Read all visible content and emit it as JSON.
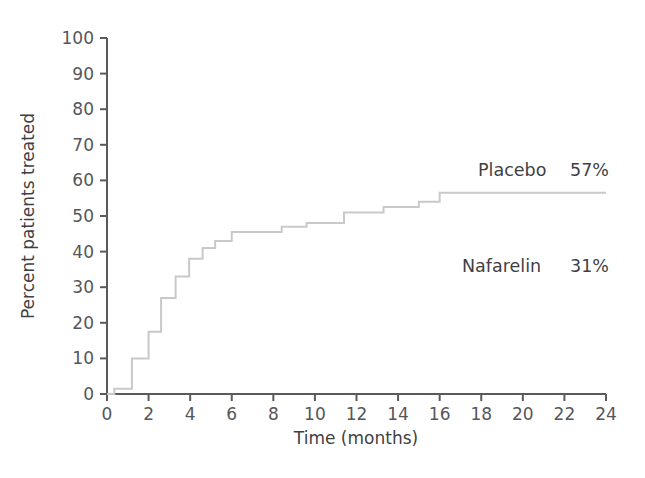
{
  "chart_data": {
    "type": "line",
    "subtype": "step-kaplan-meier-cumulative",
    "title": "",
    "xlabel": "Time (months)",
    "ylabel": "Percent patients treated",
    "xlim": [
      0,
      24
    ],
    "ylim": [
      0,
      100
    ],
    "xticks": [
      0,
      2,
      4,
      6,
      8,
      10,
      12,
      14,
      16,
      18,
      20,
      22,
      24
    ],
    "xtick_labels": [
      "0",
      "2",
      "4",
      "6",
      "8",
      "10",
      "12",
      "14",
      "16",
      "18",
      "20",
      "22",
      "24"
    ],
    "yticks": [
      0,
      10,
      20,
      30,
      40,
      50,
      60,
      70,
      80,
      90,
      100
    ],
    "ytick_labels": [
      "0",
      "10",
      "20",
      "30",
      "40",
      "50",
      "60",
      "70",
      "80",
      "90",
      "100"
    ],
    "grid": false,
    "legend_position": "inline-annotation",
    "series": [
      {
        "name": "Placebo",
        "final_value_label": "57%",
        "color": "#c9c9c9",
        "step_points": [
          [
            0,
            0
          ],
          [
            0.35,
            0
          ],
          [
            0.35,
            1.5
          ],
          [
            1.2,
            1.5
          ],
          [
            1.2,
            10
          ],
          [
            2.0,
            10
          ],
          [
            2.0,
            17.5
          ],
          [
            2.6,
            17.5
          ],
          [
            2.6,
            27
          ],
          [
            3.3,
            27
          ],
          [
            3.3,
            33
          ],
          [
            3.95,
            33
          ],
          [
            3.95,
            38
          ],
          [
            4.6,
            38
          ],
          [
            4.6,
            41
          ],
          [
            5.2,
            41
          ],
          [
            5.2,
            43
          ],
          [
            6.0,
            43
          ],
          [
            6.0,
            45.5
          ],
          [
            8.4,
            45.5
          ],
          [
            8.4,
            47
          ],
          [
            9.6,
            47
          ],
          [
            9.6,
            48
          ],
          [
            11.4,
            48
          ],
          [
            11.4,
            51
          ],
          [
            13.3,
            51
          ],
          [
            13.3,
            52.5
          ],
          [
            15.0,
            52.5
          ],
          [
            15.0,
            54
          ],
          [
            16.0,
            54
          ],
          [
            16.0,
            56.5
          ],
          [
            24,
            56.5
          ]
        ]
      },
      {
        "name": "Nafarelin",
        "final_value_label": "31%",
        "color": "#c9c9c9",
        "step_points": []
      }
    ],
    "annotations": [
      {
        "name": "placebo",
        "label": "Placebo",
        "value": "57%",
        "x_px": 478,
        "y_px": 176
      },
      {
        "name": "nafarelin",
        "label": "Nafarelin",
        "value": "31%",
        "x_px": 462,
        "y_px": 272
      }
    ]
  },
  "axes": {
    "x_axis_title": "Time (months)",
    "y_axis_title": "Percent patients treated",
    "axis_color": "#5a5a5c",
    "curve_color": "#cccccc"
  }
}
